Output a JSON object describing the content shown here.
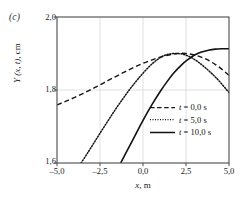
{
  "panel": {
    "label": "(c)"
  },
  "chart_data": {
    "type": "line",
    "title": "",
    "subtitle": "",
    "panel_label": "(c)",
    "xlabel": "x, m",
    "ylabel": "Y (x, t), cm",
    "xlabel_parts": {
      "symbol": "x",
      "unit": ", m"
    },
    "ylabel_parts": {
      "symbol": "Y",
      "args": " (x, t), ",
      "unit": "cm"
    },
    "xlim": [
      -5.0,
      5.0
    ],
    "ylim": [
      1.6,
      2.0
    ],
    "xticks": [
      -5.0,
      -2.5,
      0.0,
      2.5,
      5.0
    ],
    "yticks": [
      2.0,
      1.8,
      1.6
    ],
    "xticklabels": [
      "–5,0",
      "–2,5",
      "0,0",
      "2,5",
      "5,0"
    ],
    "yticklabels": [
      "2,0",
      "1,8",
      "1,6"
    ],
    "grid": true,
    "grid_color": "#d8d8d8",
    "legend_position": "lower right",
    "wave": {
      "amplitude_cm": 0.2,
      "offset_cm": 1.8,
      "wavelength_m": 20.0,
      "description": "Y(x,t) = 1,8 + 0,2 cos(2π(x - v t)/20)"
    },
    "series": [
      {
        "name": "t = 0,0 s",
        "label_parts": {
          "symbol": "t",
          "value": " = 0,0 s"
        },
        "time_s": 0.0,
        "style": "dashed",
        "color": "#151515",
        "peak_x": 0.0,
        "x": [
          -5.0,
          -4.5,
          -4.0,
          -3.5,
          -3.0,
          -2.5,
          -2.0,
          -1.5,
          -1.0,
          -0.5,
          0.0,
          0.5,
          1.0,
          1.5,
          2.0,
          2.5,
          3.0,
          3.5,
          4.0,
          4.5,
          5.0
        ],
        "y": [
          1.759,
          1.769,
          1.779,
          1.79,
          1.802,
          1.814,
          1.827,
          1.839,
          1.851,
          1.863,
          1.873,
          1.882,
          1.89,
          1.896,
          1.9,
          1.9,
          1.896,
          1.888,
          1.876,
          1.86,
          1.84
        ]
      },
      {
        "name": "t = 5,0 s",
        "label_parts": {
          "symbol": "t",
          "value": " = 5,0 s"
        },
        "time_s": 5.0,
        "style": "dotted",
        "color": "#151515",
        "peak_x": 2.3,
        "x": [
          -3.6,
          -3.2,
          -2.8,
          -2.4,
          -2.0,
          -1.6,
          -1.2,
          -0.8,
          -0.4,
          0.0,
          0.4,
          0.8,
          1.2,
          1.6,
          2.0,
          2.4,
          2.8,
          3.2,
          3.6,
          4.0,
          4.4,
          5.0
        ],
        "y": [
          1.6,
          1.629,
          1.659,
          1.689,
          1.718,
          1.747,
          1.774,
          1.8,
          1.824,
          1.846,
          1.866,
          1.882,
          1.894,
          1.899,
          1.9,
          1.897,
          1.889,
          1.877,
          1.862,
          1.845,
          1.826,
          1.793
        ]
      },
      {
        "name": "t = 10,0 s",
        "label_parts": {
          "symbol": "t",
          "value": " = 10,0 s"
        },
        "time_s": 10.0,
        "style": "solid",
        "color": "#111111",
        "peak_x": 5.0,
        "x": [
          -1.3,
          -1.0,
          -0.6,
          -0.2,
          0.2,
          0.6,
          1.0,
          1.4,
          1.8,
          2.2,
          2.6,
          3.0,
          3.4,
          3.8,
          4.2,
          4.6,
          5.0
        ],
        "y": [
          1.6,
          1.627,
          1.663,
          1.699,
          1.734,
          1.766,
          1.796,
          1.823,
          1.847,
          1.867,
          1.883,
          1.896,
          1.904,
          1.909,
          1.912,
          1.913,
          1.913
        ]
      }
    ]
  },
  "axis": {
    "top_tick_label": "2,0",
    "mid_tick_label": "1,8",
    "bottom_tick_label": "1,6"
  },
  "colors": {
    "ink": "#151515",
    "axis": "#4a4a4a",
    "grid": "#d8d8d8",
    "background": "#ffffff"
  }
}
